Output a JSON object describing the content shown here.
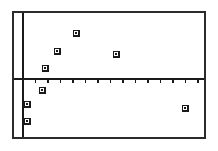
{
  "screen": {
    "width": 218,
    "height": 151,
    "background_color": "#ffffff",
    "border_color": "#2b2b2b",
    "border_width": 2,
    "frame": {
      "x": 12,
      "y": 11,
      "width": 194,
      "height": 128
    }
  },
  "axes": {
    "color": "#1a1a1a",
    "x_axis": {
      "y_pixel": 79,
      "x_start": 14,
      "x_end": 204,
      "thickness": 2
    },
    "y_axis": {
      "x_pixel": 23,
      "y_start": 13,
      "y_end": 137,
      "thickness": 2
    },
    "tick": {
      "spacing_pixels": 12.5,
      "length_pixels": 4,
      "direction": "down",
      "count": 15,
      "first_x_pixel": 35.5
    },
    "tick_labels": [],
    "axis_labels": {
      "x": "",
      "y": ""
    }
  },
  "markers": {
    "style": "square-with-center-dot",
    "outer_size": 7,
    "outer_color": "#1a1a1a",
    "inner_color": "#ffffff",
    "dot_size": 2,
    "dot_color": "#1a1a1a"
  },
  "chart_data": {
    "type": "scatter",
    "title": "",
    "subtitle": "",
    "xlabel": "",
    "ylabel": "",
    "grid": false,
    "legend": null,
    "legend_position": "none",
    "annotations": [],
    "axis_origin_pixels": {
      "x": 23,
      "y": 79
    },
    "pixels_per_unit": {
      "x": 12.5,
      "y": 12.5
    },
    "xlim": [
      -1,
      15
    ],
    "ylim": [
      -5,
      4
    ],
    "x_tick_values": [
      1,
      2,
      3,
      4,
      5,
      6,
      7,
      8,
      9,
      10,
      11,
      12,
      13,
      14,
      15
    ],
    "y_tick_values": [],
    "x_tick_labels": [],
    "y_tick_labels": [],
    "points_pixels": [
      {
        "x": 27,
        "y": 121
      },
      {
        "x": 27,
        "y": 104
      },
      {
        "x": 42,
        "y": 90
      },
      {
        "x": 45,
        "y": 68
      },
      {
        "x": 57,
        "y": 51
      },
      {
        "x": 76,
        "y": 33
      },
      {
        "x": 116,
        "y": 54
      },
      {
        "x": 185,
        "y": 108
      }
    ],
    "x": [
      0.3,
      0.3,
      1.5,
      1.8,
      2.7,
      4.2,
      7.4,
      13.0
    ],
    "y": [
      -3.4,
      -2.0,
      -0.9,
      0.9,
      2.2,
      3.7,
      2.0,
      -2.3
    ],
    "values": [
      {
        "x": 0.3,
        "y": -3.4
      },
      {
        "x": 0.3,
        "y": -2.0
      },
      {
        "x": 1.5,
        "y": -0.9
      },
      {
        "x": 1.8,
        "y": 0.9
      },
      {
        "x": 2.7,
        "y": 2.2
      },
      {
        "x": 4.2,
        "y": 3.7
      },
      {
        "x": 7.4,
        "y": 2.0
      },
      {
        "x": 13.0,
        "y": -2.3
      }
    ]
  }
}
